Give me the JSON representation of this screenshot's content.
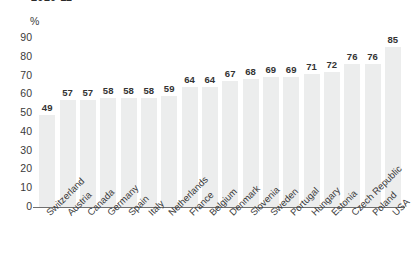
{
  "chart_data": {
    "type": "bar",
    "title": "2010-11",
    "subtitle": "",
    "xlabel": "",
    "ylabel": "%",
    "unit_label": "%",
    "ylim": [
      0,
      90
    ],
    "ytick_step": 10,
    "yticks": [
      "90",
      "80",
      "70",
      "60",
      "50",
      "40",
      "30",
      "20",
      "10",
      "0"
    ],
    "grid": false,
    "legend": "none",
    "bar_color": "#eceded",
    "axis_color": "#6f6f6f",
    "label_color": "#333333",
    "categories": [
      "Switzerland",
      "Austria",
      "Canada",
      "Germany",
      "Spain",
      "Italy",
      "Netherlands",
      "France",
      "Belgium",
      "Denmark",
      "Slovenia",
      "Sweden",
      "Portugal",
      "Hungary",
      "Estonia",
      "Czech Republic",
      "Poland",
      "USA"
    ],
    "values": [
      49,
      57,
      57,
      58,
      58,
      58,
      59,
      64,
      64,
      67,
      68,
      69,
      69,
      71,
      72,
      76,
      76,
      85
    ]
  }
}
